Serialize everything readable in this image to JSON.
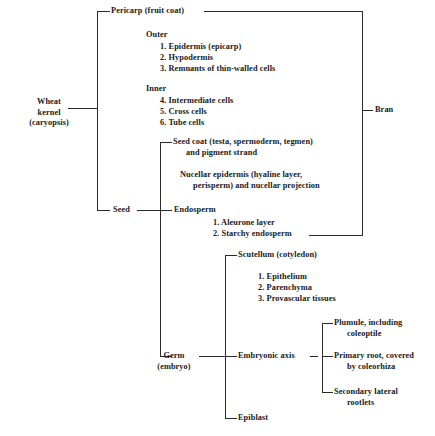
{
  "diagram": {
    "type": "bracket-tree",
    "root": {
      "label_line1": "Wheat",
      "label_line2": "kernel",
      "label_line3": "(caryopsis)"
    },
    "bran_label": "Bran",
    "branches": {
      "pericarp": {
        "label": "Pericarp (fruit coat)",
        "groups": [
          {
            "heading": "Outer",
            "items": [
              "1. Epidermis (epicarp)",
              "2. Hypodermis",
              "3. Remnants of thin-walled cells"
            ]
          },
          {
            "heading": "Inner",
            "items": [
              "4. Intermediate cells",
              "5. Cross cells",
              "6. Tube cells"
            ]
          }
        ]
      },
      "seed": {
        "label": "Seed",
        "seed_coat_line1": "Seed coat (testa, spermoderm, tegmen)",
        "seed_coat_line2": "and pigment strand",
        "nucellar_line1": "Nucellar epidermis (hyaline layer,",
        "nucellar_line2": "perisperm) and nucellar projection",
        "endosperm": {
          "label": "Endosperm",
          "items": [
            "1. Aleurone layer",
            "2. Starchy endosperm"
          ]
        },
        "germ": {
          "label_line1": "Germ",
          "label_line2": "(embryo)",
          "scutellum": {
            "label": "Scutellum (cotyledon)",
            "items": [
              "1. Epithelium",
              "2. Parenchyma",
              "3. Provascular tissues"
            ]
          },
          "embryonic_axis": {
            "label": "Embryonic axis",
            "items": [
              {
                "line1": "Plumule, including",
                "line2": "coleoptile"
              },
              {
                "line1": "Primary root, covered",
                "line2": "by coleorhiza"
              },
              {
                "line1": "Secondary lateral",
                "line2": "rootlets"
              }
            ]
          },
          "epiblast": {
            "label": "Epiblast"
          }
        }
      }
    },
    "colors": {
      "ink": "#1a1a1a",
      "rule": "#2a2a2a",
      "background": "#ffffff"
    }
  }
}
